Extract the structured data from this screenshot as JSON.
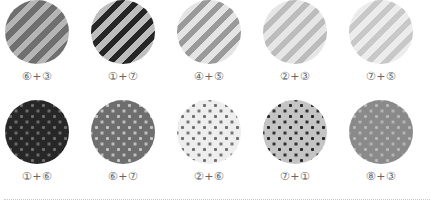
{
  "rows": [
    {
      "pattern": "stripe",
      "swatches": [
        {
          "label": "⑥+③",
          "base": "#6f6f6f",
          "accent": "#b5b5b5"
        },
        {
          "label": "①+⑦",
          "base": "#bdbdbd",
          "accent": "#262626"
        },
        {
          "label": "④+⑤",
          "base": "#e4e4e4",
          "accent": "#9a9a9a"
        },
        {
          "label": "②+③",
          "base": "#e6e6e6",
          "accent": "#bcbcbc"
        },
        {
          "label": "⑦+⑤",
          "base": "#ececec",
          "accent": "#c8c8c8"
        }
      ]
    },
    {
      "pattern": "dot",
      "swatches": [
        {
          "label": "①+⑥",
          "base": "#272727",
          "accent": "#6f6f6f"
        },
        {
          "label": "⑥+⑦",
          "base": "#6e6e6e",
          "accent": "#c4c4c4"
        },
        {
          "label": "②+⑥",
          "base": "#eeeeee",
          "accent": "#6f6f6f"
        },
        {
          "label": "⑦+①",
          "base": "#c4c4c4",
          "accent": "#262626"
        },
        {
          "label": "⑧+③",
          "base": "#8a8a8a",
          "accent": "#b8b8b8"
        }
      ]
    }
  ]
}
